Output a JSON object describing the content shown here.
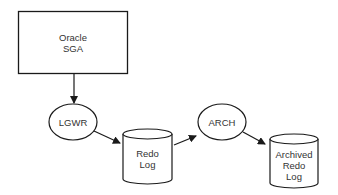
{
  "diagram": {
    "nodes": {
      "sga": {
        "label": "Oracle\nSGA",
        "shape": "rectangle"
      },
      "lgwr": {
        "label": "LGWR",
        "shape": "ellipse"
      },
      "redo_log": {
        "label": "Redo\nLog",
        "shape": "cylinder"
      },
      "arch": {
        "label": "ARCH",
        "shape": "ellipse"
      },
      "archived_redo_log": {
        "label": "Archived\nRedo\nLog",
        "shape": "cylinder"
      }
    },
    "edges": [
      {
        "from": "sga",
        "to": "lgwr"
      },
      {
        "from": "lgwr",
        "to": "redo_log"
      },
      {
        "from": "redo_log",
        "to": "arch"
      },
      {
        "from": "arch",
        "to": "archived_redo_log"
      }
    ],
    "colors": {
      "stroke": "#1a1a1a",
      "text": "#333333",
      "background": "#ffffff"
    }
  }
}
